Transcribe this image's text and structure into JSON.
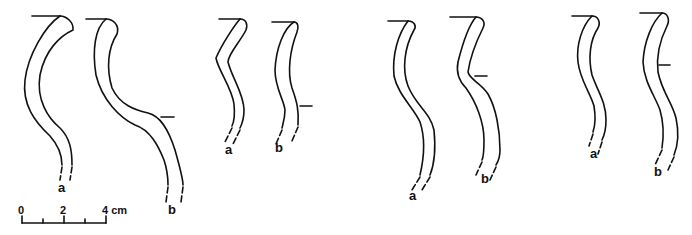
{
  "figure": {
    "line_color": "#111111",
    "background": "#ffffff",
    "pairs": [
      {
        "id": "pair-1",
        "labels": {
          "a": "a",
          "b": "b"
        }
      },
      {
        "id": "pair-2",
        "labels": {
          "a": "a",
          "b": "b"
        }
      },
      {
        "id": "pair-3",
        "labels": {
          "a": "a",
          "b": "b"
        }
      },
      {
        "id": "pair-4",
        "labels": {
          "a": "a",
          "b": "b"
        }
      }
    ],
    "scale_bar": {
      "ticks": [
        "0",
        "2",
        "4 cm"
      ],
      "unit": "cm",
      "max": 4
    }
  }
}
